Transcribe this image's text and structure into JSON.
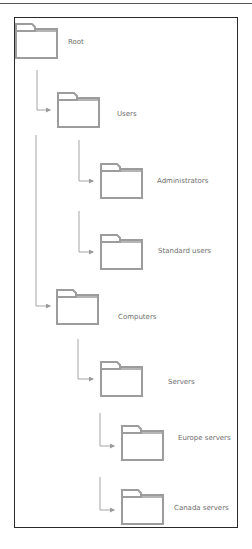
{
  "diagram": {
    "type": "hierarchy-tree",
    "colors": {
      "line": "#9a9a9a",
      "folder": "#9c9c9c",
      "text": "#6e6e6e",
      "frame": "#2a2a2a"
    },
    "nodes": [
      {
        "id": "root",
        "label": "Root",
        "parent": null,
        "icon": "folder-icon"
      },
      {
        "id": "users",
        "label": "Users",
        "parent": "root",
        "icon": "folder-icon"
      },
      {
        "id": "administrators",
        "label": "Administrators",
        "parent": "users",
        "icon": "folder-icon"
      },
      {
        "id": "standard-users",
        "label": "Standard users",
        "parent": "users",
        "icon": "folder-icon"
      },
      {
        "id": "computers",
        "label": "Computers",
        "parent": "root",
        "icon": "folder-icon"
      },
      {
        "id": "servers",
        "label": "Servers",
        "parent": "computers",
        "icon": "folder-icon"
      },
      {
        "id": "europe-servers",
        "label": "Europe servers",
        "parent": "servers",
        "icon": "folder-icon"
      },
      {
        "id": "canada-servers",
        "label": "Canada servers",
        "parent": "servers",
        "icon": "folder-icon"
      }
    ]
  }
}
